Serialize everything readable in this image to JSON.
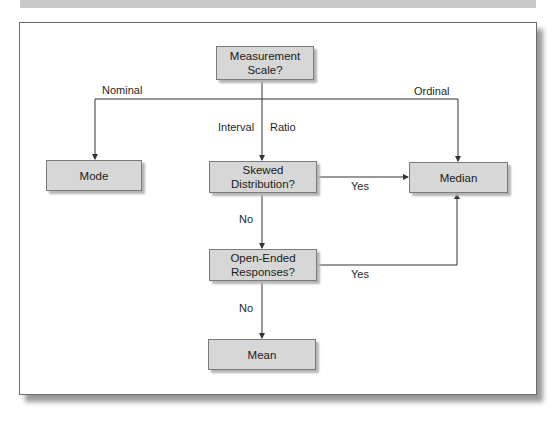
{
  "diagram": {
    "nodes": {
      "measurement_scale": "Measurement Scale?",
      "mode": "Mode",
      "median": "Median",
      "skewed": "Skewed Distribution?",
      "open_ended": "Open-Ended Responses?",
      "mean": "Mean"
    },
    "node_lines": {
      "measurement_scale": [
        "Measurement",
        "Scale?"
      ],
      "skewed": [
        "Skewed",
        "Distribution?"
      ],
      "open_ended": [
        "Open-Ended",
        "Responses?"
      ]
    },
    "edge_labels": {
      "nominal": "Nominal",
      "ordinal": "Ordinal",
      "interval": "Interval",
      "ratio": "Ratio",
      "skewed_yes": "Yes",
      "skewed_no": "No",
      "open_yes": "Yes",
      "open_no": "No"
    },
    "colors": {
      "box_fill": "#d7d7d7",
      "box_border": "#7a7a7a",
      "line": "#333333",
      "frame_border": "#6b6b6b"
    }
  }
}
